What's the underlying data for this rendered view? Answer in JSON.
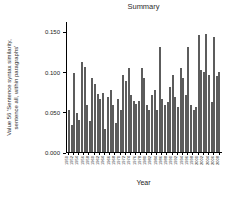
{
  "chart_data": {
    "type": "bar",
    "title": "Summary",
    "xlabel": "Year",
    "ylabel": "Value 56 'Sentence syntax similarity, sentence all, within paragraphs'",
    "ylabel_line1": "Value 56 'Sentence syntax similarity,",
    "ylabel_line2": "sentence all, within paragraphs'",
    "ylim": [
      0,
      0.16
    ],
    "ytick_labels": [
      "0.000",
      "0.050",
      "0.100",
      "0.150"
    ],
    "ytick_values": [
      0,
      0.05,
      0.1,
      0.15
    ],
    "xtick_step": 2,
    "grid": false,
    "legend": "none",
    "bar_color": "#5c5c5c",
    "axis_color": "#000000",
    "categories": [
      1950,
      1951,
      1952,
      1953,
      1954,
      1955,
      1956,
      1957,
      1958,
      1959,
      1960,
      1961,
      1962,
      1963,
      1964,
      1965,
      1966,
      1967,
      1968,
      1969,
      1970,
      1971,
      1972,
      1973,
      1974,
      1975,
      1976,
      1977,
      1978,
      1979,
      1980,
      1981,
      1982,
      1983,
      1984,
      1985,
      1986,
      1987,
      1988,
      1989,
      1990,
      1991,
      1992,
      1993,
      1994,
      1995,
      1996,
      1997,
      1998,
      1999,
      2000,
      2001,
      2002,
      2003,
      2004,
      2005,
      2006,
      2007,
      2008
    ],
    "values": [
      0.052,
      0.034,
      0.098,
      0.048,
      0.04,
      0.112,
      0.106,
      0.058,
      0.038,
      0.092,
      0.084,
      0.072,
      0.066,
      0.073,
      0.029,
      0.068,
      0.077,
      0.058,
      0.036,
      0.066,
      0.052,
      0.096,
      0.088,
      0.104,
      0.071,
      0.064,
      0.06,
      0.064,
      0.104,
      0.092,
      0.058,
      0.052,
      0.071,
      0.077,
      0.052,
      0.13,
      0.066,
      0.058,
      0.062,
      0.081,
      0.096,
      0.068,
      0.056,
      0.104,
      0.092,
      0.071,
      0.131,
      0.058,
      0.052,
      0.056,
      0.145,
      0.102,
      0.1,
      0.147,
      0.096,
      0.062,
      0.143,
      0.094,
      0.1
    ]
  }
}
